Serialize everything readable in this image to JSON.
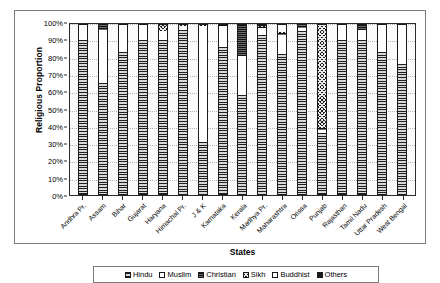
{
  "chart_data": {
    "type": "bar",
    "subtype": "stacked-percent",
    "title": "",
    "xlabel": "States",
    "ylabel": "Religious Proportion",
    "ylim": [
      0,
      100
    ],
    "ytick_labels": [
      "0%",
      "10%",
      "20%",
      "30%",
      "40%",
      "50%",
      "60%",
      "70%",
      "80%",
      "90%",
      "100%"
    ],
    "ytick_values": [
      0,
      10,
      20,
      30,
      40,
      50,
      60,
      70,
      80,
      90,
      100
    ],
    "grid": true,
    "legend_position": "bottom",
    "categories": [
      "Andhra Pr.",
      "Assam",
      "Bihar",
      "Gujarat",
      "Haryana",
      "Himachal Pr.",
      "J & K",
      "Karnataka",
      "Kerala",
      "Madhya Pr.",
      "Maharashtra",
      "Orissa",
      "Punjab",
      "Rajasthan",
      "Tamil Nadu",
      "Uttar Pradesh",
      "West Bengal"
    ],
    "series": [
      {
        "name": "Hindu",
        "pattern": "horizontal-lines",
        "values": [
          89,
          64,
          82,
          89,
          89,
          95,
          30,
          85,
          57,
          92,
          81,
          94,
          35,
          89,
          89,
          82,
          75
        ]
      },
      {
        "name": "Muslim",
        "pattern": "solid-white",
        "values": [
          9,
          31,
          16,
          9,
          5,
          2,
          67,
          12,
          23,
          4,
          11,
          2,
          2,
          9,
          6,
          18,
          25
        ]
      },
      {
        "name": "Christian",
        "pattern": "dense-horizontal-lines",
        "values": [
          1.5,
          3.5,
          0.5,
          0.5,
          0.2,
          0.2,
          0.2,
          2,
          19,
          0.8,
          1.2,
          2.5,
          1,
          0.2,
          6,
          0.2,
          0.5
        ]
      },
      {
        "name": "Sikh",
        "pattern": "cross-hatch",
        "values": [
          0.1,
          0.1,
          0.1,
          0.1,
          5.5,
          1.2,
          2,
          0.1,
          0.1,
          0.2,
          0.2,
          0.1,
          61,
          1.4,
          0.1,
          0.4,
          0.1
        ]
      },
      {
        "name": "Buddhist",
        "pattern": "solid-white",
        "values": [
          0.1,
          0.2,
          0.1,
          0.1,
          0.1,
          1.2,
          0.6,
          0.1,
          0.1,
          0.2,
          6,
          0.1,
          0.1,
          0.1,
          0.1,
          0.1,
          0.3
        ]
      },
      {
        "name": "Others",
        "pattern": "solid-black",
        "values": [
          0.3,
          1.2,
          1.3,
          1.3,
          0.2,
          0.4,
          0.2,
          0.8,
          0.8,
          2.8,
          0.6,
          1.3,
          0.9,
          0.3,
          0.8,
          0.3,
          0.1
        ]
      }
    ]
  },
  "axes": {
    "y_title": "Religious Proportion",
    "x_title": "States"
  },
  "legend": {
    "items": [
      {
        "label": "Hindu",
        "pattern": "horizontal-lines"
      },
      {
        "label": "Muslim",
        "pattern": "solid-white"
      },
      {
        "label": "Christian",
        "pattern": "dense-horizontal-lines"
      },
      {
        "label": "Sikh",
        "pattern": "cross-hatch"
      },
      {
        "label": "Buddhist",
        "pattern": "solid-white"
      },
      {
        "label": "Others",
        "pattern": "solid-black"
      }
    ]
  },
  "colors": {
    "frame": "#7b7b7b",
    "axis": "#2b2b2b",
    "grid": "#b6b6b6",
    "background": "#ffffff"
  }
}
